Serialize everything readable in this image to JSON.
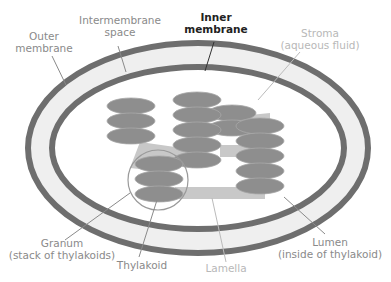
{
  "diagram": {
    "colors": {
      "membrane": "#6e6e6e",
      "intermembrane_fill": "#efefef",
      "stroma_fill": "#ffffff",
      "thylakoid": "#8e8e8e",
      "lamella": "#c4c4c4",
      "highlight_circle": "#9a9a9a",
      "leader_line": "#8a8a8a"
    },
    "labels": {
      "outer_membrane": {
        "line1": "Outer",
        "line2": "membrane"
      },
      "intermembrane_space": {
        "line1": "Intermembrane",
        "line2": "space"
      },
      "inner_membrane": {
        "line1": "Inner",
        "line2": "membrane"
      },
      "stroma": {
        "line1": "Stroma",
        "line2": "(aqueous fluid)"
      },
      "granum": {
        "line1": "Granum",
        "line2": "(stack of thylakoids)"
      },
      "thylakoid": {
        "line1": "Thylakoid"
      },
      "lamella": {
        "line1": "Lamella"
      },
      "lumen": {
        "line1": "Lumen",
        "line2": "(inside of thylakoid)"
      }
    },
    "grana": [
      {
        "name": "granum-left-top",
        "cx": 131,
        "discs": [
          106,
          121,
          136
        ]
      },
      {
        "name": "granum-center",
        "cx": 197,
        "discs": [
          100,
          115,
          130,
          145,
          160
        ]
      },
      {
        "name": "granum-right-small",
        "cx": 230,
        "discs": [
          113,
          128
        ]
      },
      {
        "name": "granum-right",
        "cx": 262,
        "discs": [
          126,
          141,
          156,
          171,
          186
        ]
      },
      {
        "name": "granum-circled",
        "cx": 159,
        "discs": [
          164,
          179,
          194
        ]
      }
    ]
  }
}
